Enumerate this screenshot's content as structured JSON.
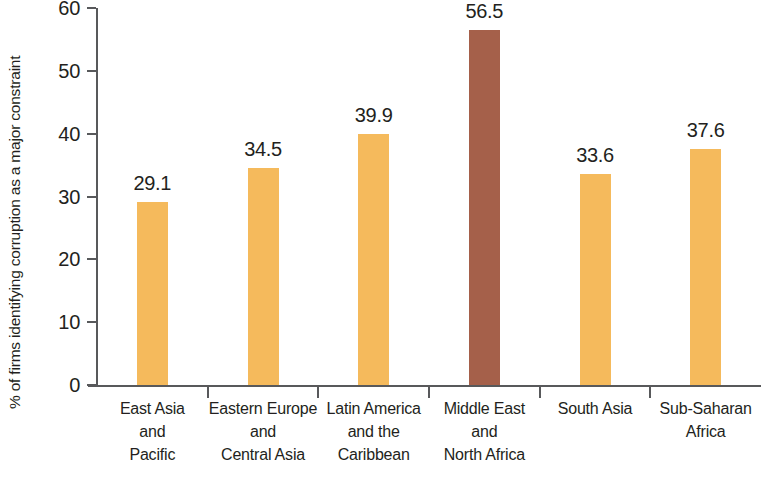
{
  "chart_data": {
    "type": "bar",
    "title": "",
    "subtitle": "",
    "xlabel": "",
    "ylabel": "% of firms identifying corruption as a major constraint",
    "ylim": [
      0,
      60
    ],
    "yticks": [
      "0",
      "10",
      "20",
      "30",
      "40",
      "50",
      "60"
    ],
    "ytick_values": [
      0,
      10,
      20,
      30,
      40,
      50,
      60
    ],
    "grid": false,
    "legend": "none",
    "categories": [
      "East Asia and Pacific",
      "Eastern Europe and Central Asia",
      "Latin America and the Caribbean",
      "Middle East and North Africa",
      "South Asia",
      "Sub-Saharan Africa"
    ],
    "category_lines": [
      [
        "East Asia",
        "and",
        "Pacific"
      ],
      [
        "Eastern Europe",
        "and",
        "Central Asia"
      ],
      [
        "Latin America",
        "and the",
        "Caribbean"
      ],
      [
        "Middle East",
        "and",
        "North Africa"
      ],
      [
        "South Asia"
      ],
      [
        "Sub-Saharan",
        "Africa"
      ]
    ],
    "values": [
      29.1,
      34.5,
      39.9,
      56.5,
      33.6,
      37.6
    ],
    "value_labels": [
      "29.1",
      "34.5",
      "39.9",
      "56.5",
      "33.6",
      "37.6"
    ],
    "bar_colors": [
      "#f5ba5c",
      "#f5ba5c",
      "#f5ba5c",
      "#a5604a",
      "#f5ba5c",
      "#f5ba5c"
    ],
    "highlight_index": 3,
    "colors": {
      "bar_default": "#f5ba5c",
      "bar_highlight": "#a5604a",
      "axis": "#58595b",
      "text": "#231f20",
      "background": "#ffffff"
    }
  }
}
